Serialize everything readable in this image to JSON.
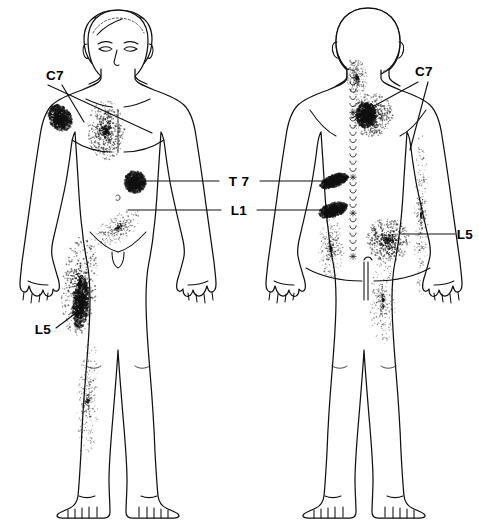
{
  "figure": {
    "background_color": "#ffffff",
    "ink_color": "#111111",
    "width": 479,
    "height": 523
  },
  "views": [
    {
      "id": "anterior",
      "name": "Anterior (front) view",
      "center_x": 118,
      "side": "left"
    },
    {
      "id": "posterior",
      "name": "Posterior (back) view",
      "center_x": 368,
      "side": "right"
    }
  ],
  "labels": [
    {
      "id": "c7-anterior",
      "text": "C7",
      "x": 55,
      "y": 80,
      "anchor": "middle",
      "view": "anterior",
      "leaders": [
        [
          [
            62,
            85
          ],
          [
            84,
            122
          ]
        ],
        [
          [
            48,
            85
          ],
          [
            152,
            133
          ]
        ]
      ]
    },
    {
      "id": "t7",
      "text": "T 7",
      "x": 239,
      "y": 186,
      "anchor": "middle",
      "view": "shared",
      "leaders": [
        [
          [
            219,
            181
          ],
          [
            137,
            181
          ]
        ],
        [
          [
            260,
            181
          ],
          [
            330,
            181
          ]
        ]
      ]
    },
    {
      "id": "l1",
      "text": "L1",
      "x": 239,
      "y": 215,
      "anchor": "middle",
      "view": "shared",
      "leaders": [
        [
          [
            221,
            210
          ],
          [
            128,
            210
          ]
        ],
        [
          [
            257,
            210
          ],
          [
            330,
            210
          ]
        ]
      ]
    },
    {
      "id": "l5-anterior",
      "text": "L5",
      "x": 43,
      "y": 334,
      "anchor": "middle",
      "view": "anterior",
      "leaders": [
        [
          [
            56,
            328
          ],
          [
            84,
            307
          ]
        ]
      ]
    },
    {
      "id": "c7-posterior",
      "text": "C7",
      "x": 424,
      "y": 76,
      "anchor": "middle",
      "view": "posterior",
      "leaders": [
        [
          [
            418,
            82
          ],
          [
            352,
            118
          ]
        ],
        [
          [
            428,
            82
          ],
          [
            410,
            150
          ]
        ]
      ]
    },
    {
      "id": "l5-posterior",
      "text": "L5",
      "x": 465,
      "y": 239,
      "anchor": "middle",
      "view": "posterior",
      "leaders": [
        [
          [
            455,
            234
          ],
          [
            402,
            234
          ]
        ]
      ]
    }
  ],
  "spine": {
    "name": "vertebral-column",
    "marked_levels": [
      "C7",
      "T7",
      "L1",
      "L5"
    ],
    "mark_positions_y": [
      112,
      175,
      210,
      255
    ],
    "x": 353,
    "top_y": 62,
    "bottom_y": 262
  },
  "pain_regions": [
    {
      "id": "c7-shoulder-anterior",
      "level": "C7",
      "view": "anterior",
      "cx": 60,
      "cy": 118,
      "rx": 11,
      "ry": 14,
      "density": "dark",
      "rot": -35
    },
    {
      "id": "c7-chest-anterior",
      "level": "C7",
      "view": "anterior",
      "cx": 106,
      "cy": 130,
      "rx": 19,
      "ry": 30,
      "density": "medium",
      "rot": 0
    },
    {
      "id": "t7-flank-anterior",
      "level": "T7",
      "view": "anterior",
      "cx": 135,
      "cy": 182,
      "rx": 11,
      "ry": 11,
      "density": "dark",
      "rot": 0
    },
    {
      "id": "l1-groin-anterior",
      "level": "L1",
      "view": "anterior",
      "cx": 118,
      "cy": 228,
      "rx": 28,
      "ry": 13,
      "density": "light",
      "rot": -35
    },
    {
      "id": "l5-thigh-anterior",
      "level": "L5",
      "view": "anterior",
      "cx": 80,
      "cy": 285,
      "rx": 18,
      "ry": 52,
      "density": "medium",
      "rot": 5
    },
    {
      "id": "l5-core-anterior",
      "level": "L5",
      "view": "anterior",
      "cx": 81,
      "cy": 303,
      "rx": 8,
      "ry": 26,
      "density": "dark",
      "rot": 5
    },
    {
      "id": "l5-leg-anterior",
      "level": "L5",
      "view": "anterior",
      "cx": 88,
      "cy": 400,
      "rx": 11,
      "ry": 62,
      "density": "light",
      "rot": 2
    },
    {
      "id": "c7-neck-posterior",
      "level": "C7",
      "view": "posterior",
      "cx": 357,
      "cy": 78,
      "rx": 10,
      "ry": 18,
      "density": "light",
      "rot": 0
    },
    {
      "id": "c7-scapula-posterior",
      "level": "C7",
      "view": "posterior",
      "cx": 372,
      "cy": 115,
      "rx": 21,
      "ry": 22,
      "density": "medium",
      "rot": 0
    },
    {
      "id": "c7-scapula-core",
      "level": "C7",
      "view": "posterior",
      "cx": 366,
      "cy": 115,
      "rx": 10,
      "ry": 13,
      "density": "dark",
      "rot": 0
    },
    {
      "id": "t7-back-posterior",
      "level": "T7",
      "view": "posterior",
      "cx": 334,
      "cy": 181,
      "rx": 15,
      "ry": 6,
      "density": "dark",
      "rot": -20
    },
    {
      "id": "l1-back-posterior",
      "level": "L1",
      "view": "posterior",
      "cx": 333,
      "cy": 210,
      "rx": 15,
      "ry": 7,
      "density": "dark",
      "rot": -18
    },
    {
      "id": "l1-buttock-posterior",
      "level": "L1",
      "view": "posterior",
      "cx": 331,
      "cy": 248,
      "rx": 13,
      "ry": 30,
      "density": "light",
      "rot": 0
    },
    {
      "id": "l5-buttock-posterior",
      "level": "L5",
      "view": "posterior",
      "cx": 388,
      "cy": 240,
      "rx": 22,
      "ry": 22,
      "density": "medium",
      "rot": 0
    },
    {
      "id": "l5-thigh-posterior",
      "level": "L5",
      "view": "posterior",
      "cx": 383,
      "cy": 300,
      "rx": 13,
      "ry": 45,
      "density": "light",
      "rot": 0
    },
    {
      "id": "l5-arm-posterior",
      "level": "L5",
      "view": "posterior",
      "cx": 421,
      "cy": 215,
      "rx": 7,
      "ry": 85,
      "density": "light",
      "rot": 0
    }
  ]
}
